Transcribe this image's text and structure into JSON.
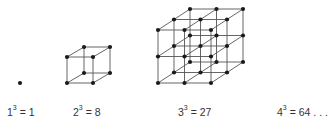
{
  "figure": {
    "items": [
      {
        "base": "1",
        "exp": "3",
        "eq": " = 1",
        "cube_n": 1
      },
      {
        "base": "2",
        "exp": "3",
        "eq": " = 8",
        "cube_n": 2
      },
      {
        "base": "3",
        "exp": "3",
        "eq": " = 27",
        "cube_n": 3
      },
      {
        "base": "4",
        "exp": "3",
        "eq": " = 64 . . .",
        "cube_n": 4
      }
    ],
    "colors": {
      "line": "#555555",
      "dot": "#1a1a1a"
    }
  }
}
